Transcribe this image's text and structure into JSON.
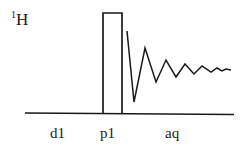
{
  "diagram": {
    "nucleus": {
      "superscript": "1",
      "symbol": "H"
    },
    "periods": [
      {
        "id": "d1",
        "label": "d1"
      },
      {
        "id": "p1",
        "label": "p1"
      },
      {
        "id": "aq",
        "label": "aq"
      }
    ],
    "colors": {
      "stroke": "#1a1a1a",
      "background": "#ffffff"
    }
  }
}
